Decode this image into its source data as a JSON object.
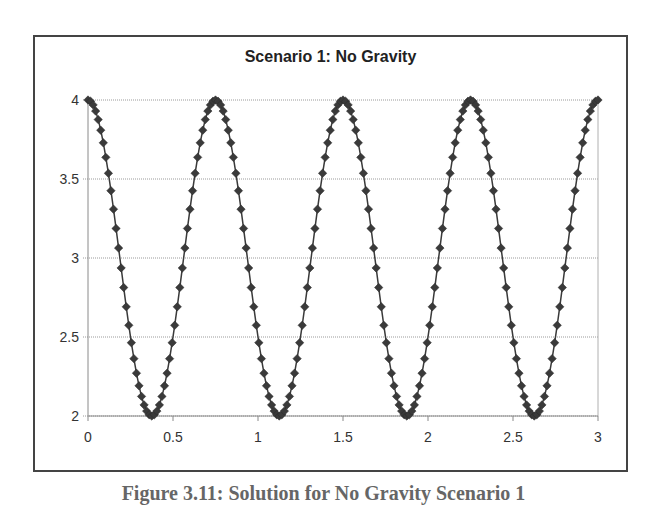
{
  "figure": {
    "caption": "Figure 3.11: Solution for No Gravity Scenario 1"
  },
  "chart_data": {
    "type": "line",
    "title": "Scenario 1: No Gravity",
    "xlabel": "",
    "ylabel": "",
    "xlim": [
      0,
      3
    ],
    "ylim": [
      2,
      4
    ],
    "x_ticks": [
      "0",
      "0.5",
      "1",
      "1.5",
      "2",
      "2.5",
      "3"
    ],
    "y_ticks": [
      "2",
      "2.5",
      "3",
      "3.5",
      "4"
    ],
    "grid": {
      "horizontal": true,
      "vertical": false,
      "style": "dotted"
    },
    "legend": null,
    "series": [
      {
        "name": "Series 1",
        "marker": "diamond",
        "color": "#3a3a3a",
        "x_start": 0,
        "x_step": 0.015,
        "values": [
          4,
          3.992,
          3.969,
          3.93,
          3.876,
          3.809,
          3.729,
          3.637,
          3.536,
          3.426,
          3.309,
          3.187,
          3.063,
          2.937,
          2.813,
          2.691,
          2.574,
          2.464,
          2.363,
          2.271,
          2.191,
          2.124,
          2.07,
          2.031,
          2.008,
          2,
          2.008,
          2.031,
          2.07,
          2.124,
          2.191,
          2.271,
          2.363,
          2.464,
          2.574,
          2.691,
          2.813,
          2.937,
          3.063,
          3.187,
          3.309,
          3.426,
          3.536,
          3.637,
          3.729,
          3.809,
          3.876,
          3.93,
          3.969,
          3.992,
          4,
          3.992,
          3.969,
          3.93,
          3.876,
          3.809,
          3.729,
          3.637,
          3.536,
          3.426,
          3.309,
          3.187,
          3.063,
          2.937,
          2.813,
          2.691,
          2.574,
          2.464,
          2.363,
          2.271,
          2.191,
          2.124,
          2.07,
          2.031,
          2.008,
          2,
          2.008,
          2.031,
          2.07,
          2.124,
          2.191,
          2.271,
          2.363,
          2.464,
          2.574,
          2.691,
          2.813,
          2.937,
          3.063,
          3.187,
          3.309,
          3.426,
          3.536,
          3.637,
          3.729,
          3.809,
          3.876,
          3.93,
          3.969,
          3.992,
          4,
          3.992,
          3.969,
          3.93,
          3.876,
          3.809,
          3.729,
          3.637,
          3.536,
          3.426,
          3.309,
          3.187,
          3.063,
          2.937,
          2.813,
          2.691,
          2.574,
          2.464,
          2.363,
          2.271,
          2.191,
          2.124,
          2.07,
          2.031,
          2.008,
          2,
          2.008,
          2.031,
          2.07,
          2.124,
          2.191,
          2.271,
          2.363,
          2.464,
          2.574,
          2.691,
          2.813,
          2.937,
          3.063,
          3.187,
          3.309,
          3.426,
          3.536,
          3.637,
          3.729,
          3.809,
          3.876,
          3.93,
          3.969,
          3.992,
          4,
          3.992,
          3.969,
          3.93,
          3.876,
          3.809,
          3.729,
          3.637,
          3.536,
          3.426,
          3.309,
          3.187,
          3.063,
          2.937,
          2.813,
          2.691,
          2.574,
          2.464,
          2.363,
          2.271,
          2.191,
          2.124,
          2.07,
          2.031,
          2.008,
          2,
          2.008,
          2.031,
          2.07,
          2.124,
          2.191,
          2.271,
          2.363,
          2.464,
          2.574,
          2.691,
          2.813,
          2.937,
          3.063,
          3.187,
          3.309,
          3.426,
          3.536,
          3.637,
          3.729,
          3.809,
          3.876,
          3.93,
          3.969,
          3.992,
          4
        ]
      }
    ]
  }
}
